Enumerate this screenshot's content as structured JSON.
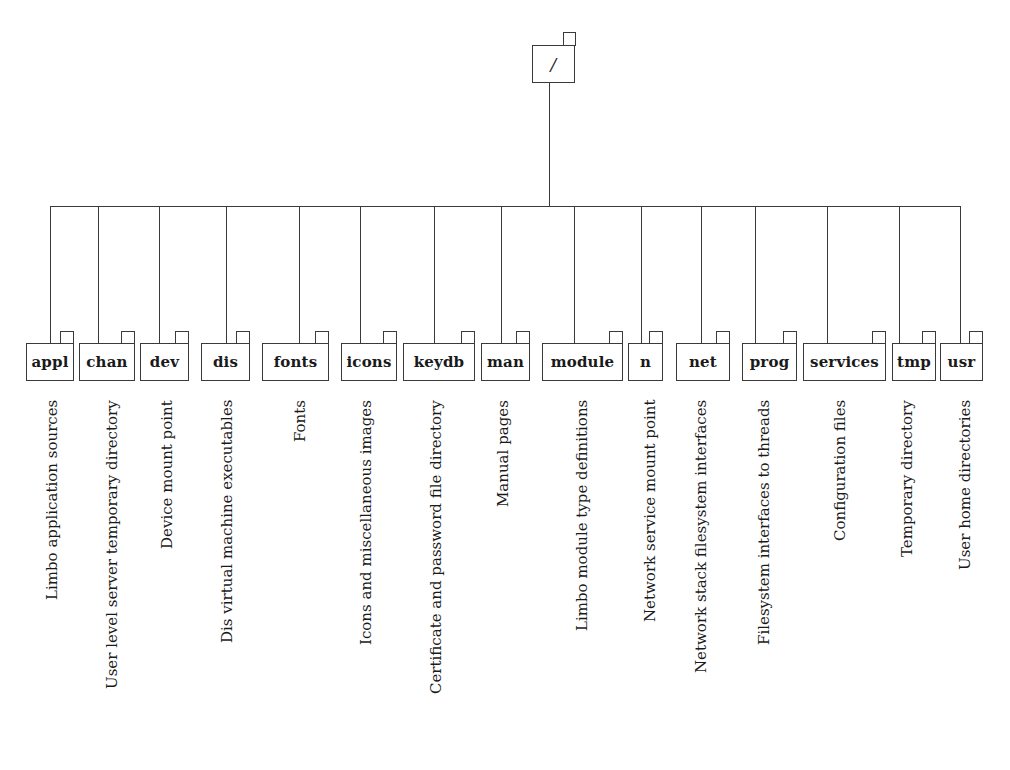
{
  "diagram": {
    "type": "directory-tree",
    "root": {
      "label": "/",
      "box": {
        "x": 532,
        "y": 45,
        "w": 43,
        "h": 38
      },
      "tab": {
        "x": 563,
        "y": 32,
        "w": 13,
        "h": 13
      }
    },
    "bus": {
      "y": 206,
      "x_start": 50,
      "x_end": 960,
      "root_x": 549
    },
    "children_box_top": 343,
    "children_box_height": 38,
    "tab_height": 12,
    "description_top": 400,
    "children": [
      {
        "name": "appl",
        "description": "Limbo application sources",
        "box_x": 26,
        "box_w": 48,
        "drop_x": 50,
        "label_x": 52
      },
      {
        "name": "chan",
        "description": "User level server temporary directory",
        "box_x": 79,
        "box_w": 56,
        "drop_x": 98,
        "label_x": 112
      },
      {
        "name": "dev",
        "description": "Device mount point",
        "box_x": 140,
        "box_w": 49,
        "drop_x": 159,
        "label_x": 167
      },
      {
        "name": "dis",
        "description": "Dis virtual machine executables",
        "box_x": 201,
        "box_w": 49,
        "drop_x": 226,
        "label_x": 227
      },
      {
        "name": "fonts",
        "description": "Fonts",
        "box_x": 262,
        "box_w": 67,
        "drop_x": 299,
        "label_x": 300
      },
      {
        "name": "icons",
        "description": "Icons and miscellaneous images",
        "box_x": 341,
        "box_w": 56,
        "drop_x": 360,
        "label_x": 366
      },
      {
        "name": "keydb",
        "description": "Certificate and password file directory",
        "box_x": 403,
        "box_w": 72,
        "drop_x": 434,
        "label_x": 436
      },
      {
        "name": "man",
        "description": "Manual pages",
        "box_x": 481,
        "box_w": 49,
        "drop_x": 501,
        "label_x": 503
      },
      {
        "name": "module",
        "description": "Limbo module type definitions",
        "box_x": 542,
        "box_w": 81,
        "drop_x": 574,
        "label_x": 582
      },
      {
        "name": "n",
        "description": "Network service mount point",
        "box_x": 628,
        "box_w": 35,
        "drop_x": 641,
        "label_x": 650
      },
      {
        "name": "net",
        "description": "Network stack filesystem interfaces",
        "box_x": 676,
        "box_w": 54,
        "drop_x": 701,
        "label_x": 701
      },
      {
        "name": "prog",
        "description": "Filesystem interfaces to threads",
        "box_x": 742,
        "box_w": 55,
        "drop_x": 755,
        "label_x": 764
      },
      {
        "name": "services",
        "description": "Configuration files",
        "box_x": 803,
        "box_w": 83,
        "drop_x": 827,
        "label_x": 840
      },
      {
        "name": "tmp",
        "description": "Temporary directory",
        "box_x": 892,
        "box_w": 44,
        "drop_x": 899,
        "label_x": 907
      },
      {
        "name": "usr",
        "description": "User home directories",
        "box_x": 940,
        "box_w": 43,
        "drop_x": 960,
        "label_x": 965
      }
    ],
    "colors": {
      "line": "#3a3a3a",
      "text": "#1a1a1a",
      "background": "#ffffff"
    }
  }
}
